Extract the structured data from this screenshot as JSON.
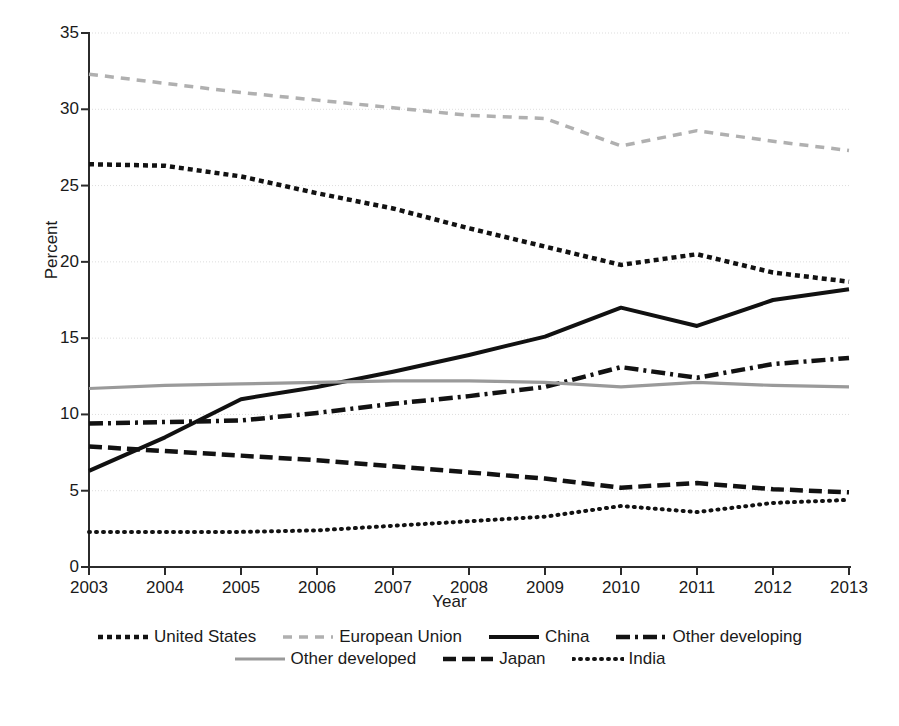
{
  "chart_data": {
    "type": "line",
    "title": "",
    "xlabel": "Year",
    "ylabel": "Percent",
    "categories": [
      "2003",
      "2004",
      "2005",
      "2006",
      "2007",
      "2008",
      "2009",
      "2010",
      "2011",
      "2012",
      "2013"
    ],
    "x": [
      2003,
      2004,
      2005,
      2006,
      2007,
      2008,
      2009,
      2010,
      2011,
      2012,
      2013
    ],
    "xlim": [
      2003,
      2013
    ],
    "ylim": [
      0,
      35
    ],
    "yticks": [
      0,
      5,
      10,
      15,
      20,
      25,
      30,
      35
    ],
    "ytick_labels": [
      "0",
      "5",
      "10",
      "15",
      "20",
      "25",
      "30",
      "35"
    ],
    "xtick_labels": [
      "2003",
      "2004",
      "2005",
      "2006",
      "2007",
      "2008",
      "2009",
      "2010",
      "2011",
      "2012",
      "2013"
    ],
    "grid": true,
    "grid_axis": "y",
    "legend_position": "below",
    "series": [
      {
        "name": "United States",
        "style": "square-dotted",
        "color": "#121212",
        "width": 4.5,
        "dash": "5,4",
        "values": [
          26.4,
          26.3,
          25.6,
          24.5,
          23.5,
          22.2,
          21.0,
          19.8,
          20.5,
          19.3,
          18.7
        ]
      },
      {
        "name": "European Union",
        "style": "dashed-light",
        "color": "#b0b0b0",
        "width": 3.5,
        "dash": "9,7",
        "values": [
          32.3,
          31.7,
          31.1,
          30.6,
          30.1,
          29.6,
          29.4,
          27.6,
          28.6,
          27.9,
          27.3
        ]
      },
      {
        "name": "China",
        "style": "solid",
        "color": "#111111",
        "width": 4.0,
        "dash": "none",
        "values": [
          6.3,
          8.5,
          11.0,
          11.8,
          12.8,
          13.9,
          15.1,
          17.0,
          15.8,
          17.5,
          18.2
        ]
      },
      {
        "name": "Other developing",
        "style": "dash-dot",
        "color": "#121212",
        "width": 4.5,
        "dash": "14,5,3,5",
        "values": [
          9.4,
          9.5,
          9.6,
          10.1,
          10.7,
          11.2,
          11.8,
          13.1,
          12.4,
          13.3,
          13.7
        ]
      },
      {
        "name": "Other developed",
        "style": "solid-gray",
        "color": "#9a9a9a",
        "width": 3.2,
        "dash": "none",
        "values": [
          11.7,
          11.9,
          12.0,
          12.1,
          12.2,
          12.2,
          12.1,
          11.8,
          12.1,
          11.9,
          11.8
        ]
      },
      {
        "name": "Japan",
        "style": "dashed",
        "color": "#121212",
        "width": 4.5,
        "dash": "13,6",
        "values": [
          7.9,
          7.6,
          7.3,
          7.0,
          6.6,
          6.2,
          5.8,
          5.2,
          5.5,
          5.1,
          4.9
        ]
      },
      {
        "name": "India",
        "style": "dotted",
        "color": "#121212",
        "width": 4.0,
        "dash": "1,6",
        "values": [
          2.3,
          2.3,
          2.3,
          2.4,
          2.7,
          3.0,
          3.3,
          4.0,
          3.6,
          4.2,
          4.4
        ]
      }
    ]
  },
  "legend": {
    "rows": [
      [
        "United States",
        "European Union",
        "China",
        "Other developing"
      ],
      [
        "Other developed",
        "Japan",
        "India"
      ]
    ]
  },
  "colors": {
    "axis": "#2b2b2b",
    "grid": "#dddddd",
    "text": "#1a1a1a",
    "background": "#ffffff"
  }
}
